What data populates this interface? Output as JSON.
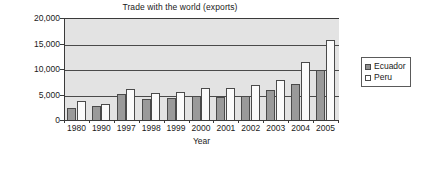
{
  "chart_data": {
    "type": "bar",
    "title": "Trade with the world (exports)",
    "xlabel": "Year",
    "ylabel": "Value (in US$ million)",
    "categories": [
      "1980",
      "1990",
      "1997",
      "1998",
      "1999",
      "2000",
      "2001",
      "2002",
      "2003",
      "2004",
      "2005"
    ],
    "series": [
      {
        "name": "Ecuador",
        "color": "#9a9a9a",
        "values": [
          2550,
          2950,
          5350,
          4350,
          4450,
          4950,
          4700,
          4950,
          6100,
          7300,
          10100
        ]
      },
      {
        "name": "Peru",
        "color": "#fbfbfb",
        "values": [
          3900,
          3250,
          6350,
          5400,
          5700,
          6450,
          6500,
          7150,
          8000,
          11600,
          15900
        ]
      }
    ],
    "ylim": [
      0,
      20000
    ],
    "yticks": [
      0,
      5000,
      10000,
      15000,
      20000
    ],
    "ytick_labels": [
      "0",
      "5,000",
      "10,000",
      "15,000",
      "20,000"
    ],
    "grid": true,
    "grid_axis": "y",
    "legend_position": "right",
    "plot_background": "#e3e3e3"
  }
}
